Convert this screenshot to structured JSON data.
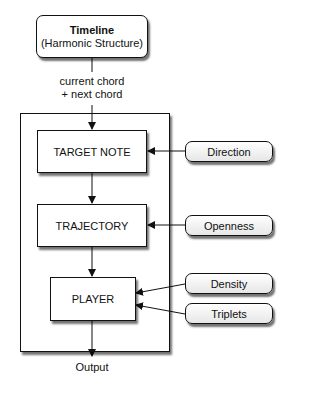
{
  "timeline": {
    "title": "Timeline",
    "subtitle": "(Harmonic Structure)"
  },
  "input_label": {
    "line1": "current chord",
    "line2": "+ next chord"
  },
  "modules": {
    "target_note": "TARGET NOTE",
    "trajectory": "TRAJECTORY",
    "player": "PLAYER"
  },
  "parameters": {
    "direction": "Direction",
    "openness": "Openness",
    "density": "Density",
    "triplets": "Triplets"
  },
  "output_label": "Output"
}
